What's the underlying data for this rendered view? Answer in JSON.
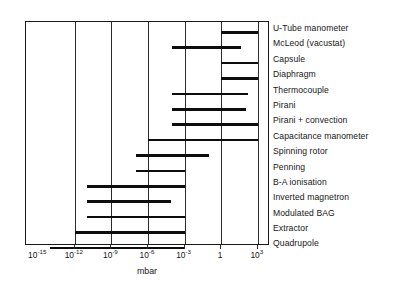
{
  "chart_data": {
    "type": "bar",
    "orientation": "horizontal-range",
    "title": "",
    "subtitle": "",
    "xlabel": "mbar",
    "ylabel": "",
    "xscale": "log",
    "xlim": [
      1e-16,
      10000.0
    ],
    "grid": true,
    "legend": false,
    "legend_position": "none",
    "axis_note": "Gauge measurement ranges versus pressure in mbar (logarithmic axis)",
    "xticks": [
      {
        "value": 1e-15,
        "mantissa": "10",
        "exponent": "-15",
        "label": "10-15"
      },
      {
        "value": 1e-12,
        "mantissa": "10",
        "exponent": "-12",
        "label": "10-12"
      },
      {
        "value": 1e-09,
        "mantissa": "10",
        "exponent": "-9",
        "label": "10-9"
      },
      {
        "value": 1e-06,
        "mantissa": "10",
        "exponent": "-6",
        "label": "10-6"
      },
      {
        "value": 0.001,
        "mantissa": "10",
        "exponent": "-3",
        "label": "10-3"
      },
      {
        "value": 1,
        "mantissa": "1",
        "exponent": "",
        "label": "1"
      },
      {
        "value": 1000.0,
        "mantissa": "10",
        "exponent": "3",
        "label": "103"
      }
    ],
    "gridline_values": [
      1e-12,
      1e-09,
      1e-06,
      0.001,
      1,
      1000.0
    ],
    "categories": [
      "U-Tube manometer",
      "McLeod (vacustat)",
      "Capsule",
      "Diaphragm",
      "Thermocouple",
      "Pirani",
      "Pirani + convection",
      "Capacitance manometer",
      "Spinning rotor",
      "Penning",
      "B-A ionisation",
      "Inverted magnetron",
      "Modulated BAG",
      "Extractor",
      "Quadrupole"
    ],
    "ranges": [
      {
        "name": "U-Tube manometer",
        "min": 1,
        "max": 1000,
        "min_exp": 0,
        "max_exp": 3
      },
      {
        "name": "McLeod (vacustat)",
        "min": 0.0001,
        "max": 40,
        "min_exp": -4,
        "max_exp": 1.6
      },
      {
        "name": "Capsule",
        "min": 1,
        "max": 1000,
        "min_exp": 0,
        "max_exp": 3
      },
      {
        "name": "Diaphragm",
        "min": 1,
        "max": 1000,
        "min_exp": 0,
        "max_exp": 3
      },
      {
        "name": "Thermocouple",
        "min": 0.0001,
        "max": 150,
        "min_exp": -4,
        "max_exp": 2.2
      },
      {
        "name": "Pirani",
        "min": 0.0001,
        "max": 100,
        "min_exp": -4,
        "max_exp": 2.0
      },
      {
        "name": "Pirani + convection",
        "min": 0.0001,
        "max": 1000,
        "min_exp": -4,
        "max_exp": 3
      },
      {
        "name": "Capacitance manometer",
        "min": 1e-06,
        "max": 1000,
        "min_exp": -6,
        "max_exp": 3
      },
      {
        "name": "Spinning rotor",
        "min": 1e-07,
        "max": 0.1,
        "min_exp": -7,
        "max_exp": -1
      },
      {
        "name": "Penning",
        "min": 1e-07,
        "max": 0.001,
        "min_exp": -7,
        "max_exp": -3
      },
      {
        "name": "B-A ionisation",
        "min": 1e-11,
        "max": 0.001,
        "min_exp": -11,
        "max_exp": -3
      },
      {
        "name": "Inverted magnetron",
        "min": 1e-11,
        "max": 0.0001,
        "min_exp": -11,
        "max_exp": -4.1
      },
      {
        "name": "Modulated BAG",
        "min": 1e-11,
        "max": 0.001,
        "min_exp": -11,
        "max_exp": -3
      },
      {
        "name": "Extractor",
        "min": 1e-12,
        "max": 0.001,
        "min_exp": -12,
        "max_exp": -3
      },
      {
        "name": "Quadrupole",
        "min": 1e-14,
        "max": 0.001,
        "min_exp": -14,
        "max_exp": -3
      }
    ]
  },
  "axis": {
    "x_title": "mbar"
  },
  "colors": {
    "bar": "#0d0d0d",
    "frame": "#1a1a1a",
    "grid": "#2b2b2b",
    "text": "#161616",
    "background": "#ffffff"
  }
}
